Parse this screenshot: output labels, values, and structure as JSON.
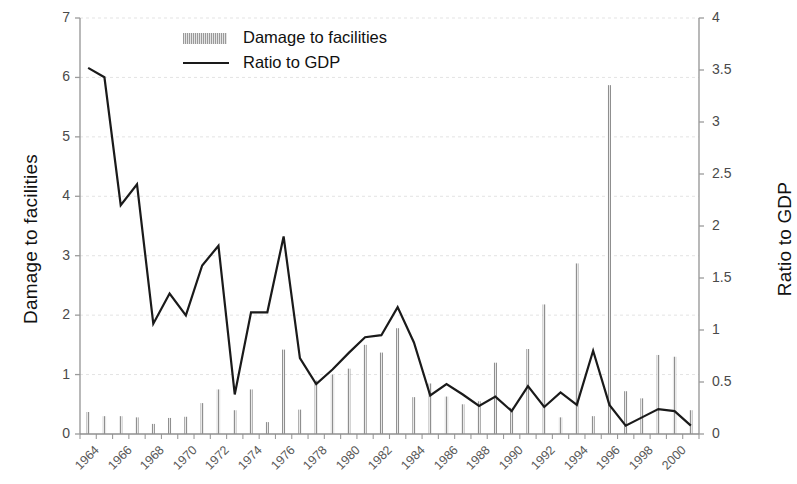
{
  "chart_data": {
    "type": "bar",
    "title": "",
    "subtitle": "",
    "xlabel": "",
    "ylabel": "Damage to facilities",
    "ylabel_right": "Ratio to GDP",
    "grid": true,
    "legend_position": "top-center",
    "ylim": [
      0,
      7
    ],
    "ylim_right": [
      0,
      4
    ],
    "yticks": [
      "0",
      "1",
      "2",
      "3",
      "4",
      "5",
      "6",
      "7"
    ],
    "ytick_values": [
      0,
      1,
      2,
      3,
      4,
      5,
      6,
      7
    ],
    "yticks_right": [
      "0",
      "0.5",
      "1",
      "1.5",
      "2",
      "2.5",
      "3",
      "3.5",
      "4"
    ],
    "ytick_values_right": [
      0,
      0.5,
      1,
      1.5,
      2,
      2.5,
      3,
      3.5,
      4
    ],
    "x": [
      1964,
      1965,
      1966,
      1967,
      1968,
      1969,
      1970,
      1971,
      1972,
      1973,
      1974,
      1975,
      1976,
      1977,
      1978,
      1979,
      1980,
      1981,
      1982,
      1983,
      1984,
      1985,
      1986,
      1987,
      1988,
      1989,
      1990,
      1991,
      1992,
      1993,
      1994,
      1995,
      1996,
      1997,
      1998,
      1999,
      2000,
      2001
    ],
    "xtick_labels": [
      "1964",
      "1966",
      "1968",
      "1970",
      "1972",
      "1974",
      "1976",
      "1978",
      "1980",
      "1982",
      "1984",
      "1986",
      "1988",
      "1990",
      "1992",
      "1994",
      "1996",
      "1998",
      "2000"
    ],
    "xtick_values": [
      1964,
      1966,
      1968,
      1970,
      1972,
      1974,
      1976,
      1978,
      1980,
      1982,
      1984,
      1986,
      1988,
      1990,
      1992,
      1994,
      1996,
      1998,
      2000
    ],
    "series": [
      {
        "name": "Damage to facilities",
        "type": "bar",
        "axis": "left",
        "color": "#8c8c8c",
        "values": [
          0.37,
          0.3,
          0.3,
          0.28,
          0.17,
          0.27,
          0.29,
          0.52,
          0.75,
          0.4,
          0.75,
          0.2,
          1.42,
          0.41,
          0.9,
          1.0,
          1.1,
          1.5,
          1.37,
          1.78,
          0.62,
          0.85,
          0.63,
          0.5,
          0.55,
          1.2,
          0.44,
          1.43,
          2.18,
          0.28,
          2.87,
          0.3,
          5.87,
          0.72,
          0.6,
          1.33,
          1.3,
          0.4
        ]
      },
      {
        "name": "Ratio to GDP",
        "type": "line",
        "axis": "right",
        "color": "#1a1a1a",
        "values": [
          3.52,
          3.43,
          2.2,
          2.4,
          1.06,
          1.35,
          1.14,
          1.62,
          1.81,
          0.38,
          1.17,
          1.17,
          1.9,
          0.73,
          0.48,
          0.62,
          0.78,
          0.93,
          0.95,
          1.22,
          0.88,
          0.37,
          0.48,
          0.38,
          0.27,
          0.36,
          0.22,
          0.46,
          0.26,
          0.4,
          0.28,
          0.8,
          0.28,
          0.08,
          0.16,
          0.24,
          0.22,
          0.08
        ]
      }
    ],
    "legend": [
      {
        "label": "Damage to facilities",
        "marker": "bar-swatch"
      },
      {
        "label": "Ratio to GDP",
        "marker": "line-swatch"
      }
    ]
  }
}
